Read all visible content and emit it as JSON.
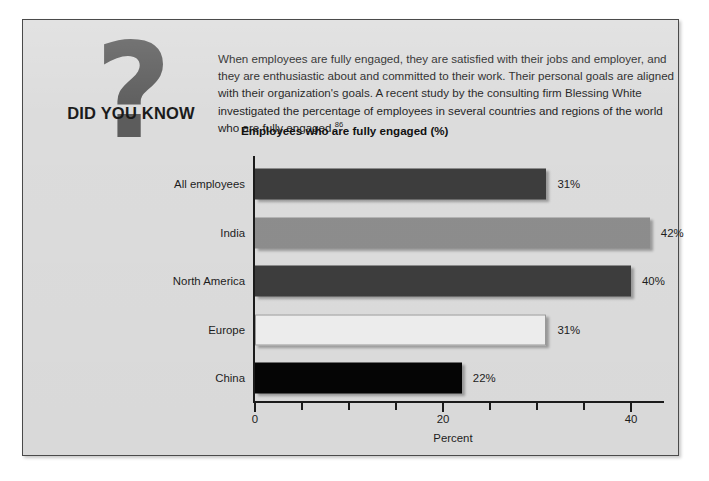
{
  "badge": {
    "icon": "question-mark-icon",
    "glyph": "?",
    "label": "DID YOU KNOW"
  },
  "intro": {
    "text": "When employees are fully engaged, they are satisfied with their jobs and employer, and they are enthusiastic about and committed to their work. Their personal goals are aligned with their organization's goals. A recent study by the consulting firm Blessing White investigated the percentage of employees in several countries and regions of the world who are fully engaged.",
    "footnote": "86"
  },
  "chart_data": {
    "type": "bar",
    "orientation": "horizontal",
    "title": "Employees who are fully engaged (%)",
    "xlabel": "Percent",
    "ylabel": "",
    "categories": [
      "All employees",
      "India",
      "North America",
      "Europe",
      "China"
    ],
    "values": [
      31,
      42,
      40,
      31,
      22
    ],
    "value_labels": [
      "31%",
      "42%",
      "40%",
      "31%",
      "22%"
    ],
    "bar_colors": [
      "#3d3d3d",
      "#8d8d8d",
      "#3d3d3d",
      "#eeeeee",
      "#050505"
    ],
    "bar_borders": [
      "none",
      "none",
      "none",
      "#9a9a9a",
      "none"
    ],
    "xlim": [
      0,
      45
    ],
    "xticks_major": [
      0,
      20,
      40
    ],
    "xtick_labels": [
      "0",
      "20",
      "40"
    ],
    "xticks_minor": [
      5,
      10,
      15,
      25,
      30,
      35
    ],
    "grid": false,
    "legend": false
  },
  "colors": {
    "panel_background": "#dcdcdc",
    "panel_border": "#4a4a4a",
    "page_background": "#ffffff",
    "axis": "#1b1b1b",
    "text": "#1c1c1c",
    "badge_mark": "#5c5c5c"
  }
}
